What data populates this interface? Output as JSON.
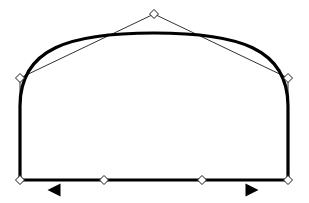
{
  "canvas": {
    "width": 309,
    "height": 203,
    "background_color": "#ffffff",
    "stroke_color": "#000000",
    "guide_color": "#1a1a1a",
    "handle_fill": "#ffffff",
    "title": "Bezier path editing canvas"
  },
  "path": {
    "name": "arch-shape-path",
    "stroke_color": "#000000",
    "stroke_width": 3.2,
    "fill": "none",
    "closed": true,
    "description": "Closed arch / dome outline with flat bottom edge and rounded shoulders",
    "d": "M 20 180 L 288 180 L 288 106 C 288 48 238 33 154 33 C 70 33 20 48 20 106 Z"
  },
  "control_polygon": {
    "name": "control-polygon",
    "stroke_color": "#1a1a1a",
    "stroke_width": 0.9,
    "segments": [
      {
        "name": "bottom-edge",
        "x1": 20,
        "y1": 180,
        "x2": 288,
        "y2": 180
      },
      {
        "name": "left-edge",
        "x1": 20,
        "y1": 78,
        "x2": 20,
        "y2": 180
      },
      {
        "name": "right-edge",
        "x1": 288,
        "y1": 78,
        "x2": 288,
        "y2": 180
      },
      {
        "name": "left-apex-handle",
        "x1": 20,
        "y1": 78,
        "x2": 154,
        "y2": 14
      },
      {
        "name": "right-apex-handle",
        "x1": 288,
        "y1": 78,
        "x2": 154,
        "y2": 14
      }
    ]
  },
  "handles": [
    {
      "name": "node-apex-top",
      "x": 154,
      "y": 14,
      "size": 9,
      "type": "diamond",
      "state": "unselected"
    },
    {
      "name": "node-left-shoulder",
      "x": 20,
      "y": 78,
      "size": 9,
      "type": "diamond",
      "state": "unselected"
    },
    {
      "name": "node-right-shoulder",
      "x": 288,
      "y": 78,
      "size": 9,
      "type": "diamond",
      "state": "unselected"
    },
    {
      "name": "node-bottom-left-corner",
      "x": 20,
      "y": 180,
      "size": 9,
      "type": "diamond",
      "state": "unselected"
    },
    {
      "name": "node-bottom-mid-left",
      "x": 104,
      "y": 180,
      "size": 9,
      "type": "diamond",
      "state": "unselected"
    },
    {
      "name": "node-bottom-mid-right",
      "x": 202,
      "y": 180,
      "size": 9,
      "type": "diamond",
      "state": "unselected"
    },
    {
      "name": "node-bottom-right-corner",
      "x": 288,
      "y": 180,
      "size": 9,
      "type": "diamond",
      "state": "unselected"
    }
  ],
  "direction_markers": [
    {
      "name": "marker-left-arrow",
      "x": 54,
      "y": 190,
      "direction": "left",
      "glyph": "◀",
      "fill": "#000000",
      "width": 13,
      "height": 13
    },
    {
      "name": "marker-right-arrow",
      "x": 252,
      "y": 190,
      "direction": "right",
      "glyph": "▶",
      "fill": "#000000",
      "width": 13,
      "height": 13
    }
  ]
}
